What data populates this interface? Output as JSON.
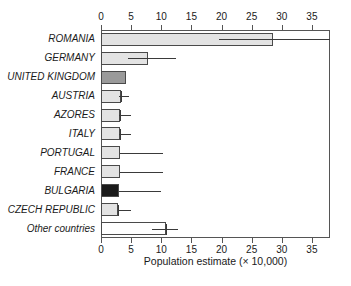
{
  "chart_data": {
    "type": "bar",
    "orientation": "horizontal",
    "title": "",
    "xlabel": "Population estimate (× 10,000)",
    "ylabel": "",
    "xlim": [
      0,
      38
    ],
    "xticks": [
      0,
      5,
      10,
      15,
      20,
      25,
      30,
      35
    ],
    "xtick_labels": [
      "0",
      "5",
      "10",
      "15",
      "20",
      "25",
      "30",
      "35"
    ],
    "grid": false,
    "legend": "none",
    "axis_note": "tick labels repeated on top and bottom axes",
    "categories": [
      "ROMANIA",
      "GERMANY",
      "UNITED KINGDOM",
      "AUSTRIA",
      "AZORES",
      "ITALY",
      "PORTUGAL",
      "FRANCE",
      "BULGARIA",
      "CZECH REPUBLIC",
      "Other countries"
    ],
    "values": [
      28.5,
      7.8,
      4.2,
      3.4,
      3.2,
      3.2,
      3.2,
      3.1,
      3.0,
      2.8,
      10.8
    ],
    "error_low": [
      19.5,
      4.5,
      null,
      3.0,
      3.0,
      3.0,
      3.2,
      3.1,
      3.0,
      2.8,
      8.5
    ],
    "error_high": [
      38.0,
      12.5,
      null,
      4.7,
      5.0,
      5.0,
      10.3,
      10.3,
      10.0,
      5.0,
      12.8
    ],
    "error_note": "ROMANIA upper error extends past the right edge of the axis",
    "fills": [
      "#e3e3e3",
      "#e3e3e3",
      "#9a9a9a",
      "#e3e3e3",
      "#e3e3e3",
      "#e3e3e3",
      "#e3e3e3",
      "#e3e3e3",
      "#1a1a1a",
      "#e3e3e3",
      "#ffffff"
    ],
    "colors": {
      "light_gray_fill": "#e3e3e3",
      "medium_gray_fill": "#9a9a9a",
      "black_fill": "#1a1a1a",
      "white_fill": "#ffffff",
      "outline": "#4a4a4a",
      "axis": "#555555",
      "text": "#1a1a1a"
    }
  }
}
